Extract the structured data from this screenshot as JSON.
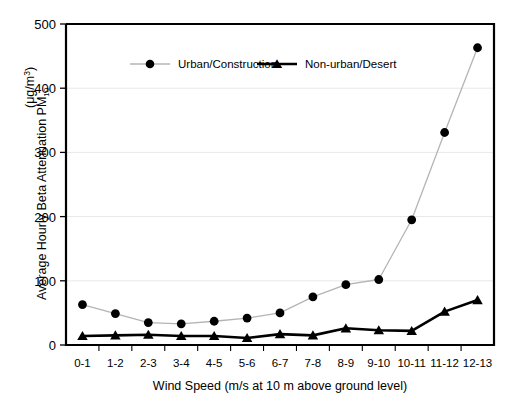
{
  "chart_data": {
    "type": "line",
    "title": "",
    "xlabel": "Wind Speed (m/s at 10 m above ground level)",
    "ylabel_main": "Average Hourly Beta Attenuation PM",
    "ylabel_sub": "10",
    "ylabel_units_open": "(",
    "ylabel_units_mu": "μg/m",
    "ylabel_units_sup": "3",
    "ylabel_units_close": ")",
    "ylabel_full": "Average Hourly Beta Attenuation PM10 (μg/m3)",
    "categories": [
      "0-1",
      "1-2",
      "2-3",
      "3-4",
      "4-5",
      "5-6",
      "6-7",
      "7-8",
      "8-9",
      "9-10",
      "10-11",
      "11-12",
      "12-13"
    ],
    "ylim": [
      0,
      500
    ],
    "ytick_labels": [
      "0",
      "100",
      "200",
      "300",
      "400",
      "500"
    ],
    "ytick_values": [
      0,
      100,
      200,
      300,
      400,
      500
    ],
    "grid": "horizontal",
    "legend_position": "top-center-inside",
    "series": [
      {
        "name": "Urban/Construction",
        "marker": "circle",
        "marker_color": "#000000",
        "line_color": "#b4b4b4",
        "values": [
          63,
          49,
          35,
          33,
          37,
          42,
          50,
          75,
          94,
          102,
          195,
          331,
          463
        ]
      },
      {
        "name": "Non-urban/Desert",
        "marker": "triangle",
        "marker_color": "#000000",
        "line_color": "#000000",
        "values": [
          14,
          15,
          16,
          14,
          14,
          11,
          17,
          15,
          26,
          23,
          22,
          52,
          70
        ]
      }
    ]
  },
  "colors": {
    "axis": "#000000",
    "grid": "#e8e8e8",
    "background": "#ffffff"
  }
}
